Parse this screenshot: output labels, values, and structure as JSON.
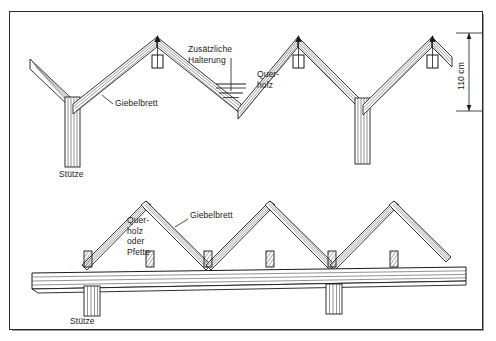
{
  "figure": {
    "kind": "technical-construction-drawing",
    "language": "de"
  },
  "top_view": {
    "name": "obere Ansicht",
    "labels": {
      "zusaetzliche_halterung": "Zusätzliche\nHalterung",
      "querholz": "Quer-\nholz",
      "giebelbrett": "Giebelbrett",
      "stuetze": "Stütze"
    },
    "dimension": {
      "value": "110 cm",
      "orientation": "vertical"
    }
  },
  "bottom_view": {
    "name": "untere Ansicht",
    "labels": {
      "querholz_oder_pfette": "Quer-\nholz\noder\nPfette",
      "giebelbrett": "Giebelbrett",
      "stuetze": "Stütze"
    }
  },
  "colors": {
    "line": "#1a1a1a",
    "hatch": "#555555",
    "frame": "#2b2b2b",
    "background": "#ffffff"
  }
}
